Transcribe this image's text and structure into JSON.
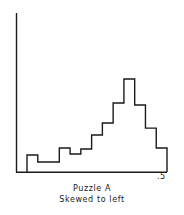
{
  "figure": {
    "caption_line1": "Puzzle A",
    "caption_line2": "Skewed to left",
    "axis_max_label": ".5",
    "line_color": "#1a1a1a",
    "background_color": "#ffffff"
  },
  "chart_data": {
    "type": "bar",
    "title": "Puzzle A",
    "subtitle": "Skewed to left",
    "xlabel": "",
    "ylabel": "",
    "grid": false,
    "legend": false,
    "axis_style": "left-and-bottom-spines",
    "xlim": [
      0,
      0.5
    ],
    "ylim": [
      0,
      1
    ],
    "xtick_values": [
      0.5
    ],
    "xtick_labels": [
      ".5"
    ],
    "ytick_values": [],
    "ytick_labels": [],
    "bin_edges": [
      0.036,
      0.072,
      0.108,
      0.143,
      0.179,
      0.215,
      0.251,
      0.287,
      0.323,
      0.358,
      0.394,
      0.43,
      0.466,
      0.5
    ],
    "categories": [
      "b1",
      "b2",
      "b3",
      "b4",
      "b5",
      "b6",
      "b7",
      "b8",
      "b9",
      "b10",
      "b11",
      "b12",
      "b13"
    ],
    "values": [
      0.107,
      0.063,
      0.063,
      0.151,
      0.113,
      0.145,
      0.233,
      0.308,
      0.434,
      0.585,
      0.421,
      0.276,
      0.151
    ],
    "peak_bin_index": 9,
    "peak_value": 0.585,
    "note": "relative frequency histogram, unimodal with long left tail"
  }
}
